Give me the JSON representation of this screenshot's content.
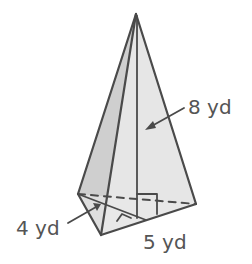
{
  "figure": {
    "type": "triangular pyramid",
    "labels": {
      "height": "8 yd",
      "base_height": "4 yd",
      "base_side": "5 yd"
    },
    "colors": {
      "stroke": "#4a4a4a",
      "left_face": "#cfcfcf",
      "right_face": "#e6e6e6",
      "text": "#555555"
    }
  }
}
